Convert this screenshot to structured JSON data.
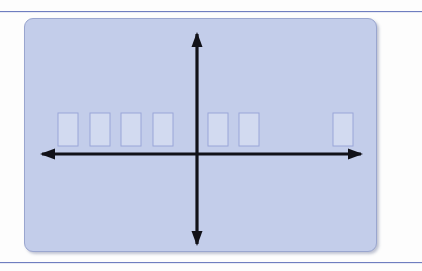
{
  "slide": {
    "background_color": "#fdfdfd",
    "rule_color": "#6f7ec0",
    "title": ""
  },
  "panel": {
    "name": "coordinate-plane-panel",
    "fill_color": "#c3cdea",
    "border_color": "#9aa6cf",
    "x": 24,
    "y": 18,
    "width": 351,
    "height": 232,
    "corner_radius": 9
  },
  "axes": {
    "color": "#111118",
    "stroke_width": 3.2,
    "origin": {
      "x": 172,
      "y": 135
    },
    "x_axis": {
      "name": "x-axis",
      "from_x": 17,
      "to_x": 336,
      "y": 135,
      "arrow_left": true,
      "arrow_right": true,
      "label": ""
    },
    "y_axis": {
      "name": "y-axis",
      "from_y": 15,
      "to_y": 225,
      "x": 172,
      "arrow_up": true,
      "arrow_down": true,
      "label": ""
    }
  },
  "chart_data": {
    "type": "bar",
    "title": "",
    "subtitle": "",
    "xlabel": "",
    "ylabel": "",
    "grid": false,
    "legend": null,
    "annotations": [],
    "axis_style": "double-arrow cartesian axes",
    "note": "Seven equal-height light rectangles resting on the x-axis; four left of the origin, two just right of the origin, and one isolated at the far right.",
    "bar_fill_color": "#d2daf0",
    "bar_border_color": "#9aa6d8",
    "bar_width": 20,
    "bar_height": 33,
    "baseline_y": 135,
    "categories": [
      "1",
      "2",
      "3",
      "4",
      "5",
      "6",
      "7"
    ],
    "values": [
      33,
      33,
      33,
      33,
      33,
      33,
      33
    ],
    "xlim": [
      17,
      336
    ],
    "ylim": [
      15,
      225
    ],
    "bars": [
      {
        "index": 0,
        "name": "bar-1",
        "x": 33,
        "y": 94,
        "width": 20,
        "height": 33,
        "side": "left-of-origin"
      },
      {
        "index": 1,
        "name": "bar-2",
        "x": 65,
        "y": 94,
        "width": 20,
        "height": 33,
        "side": "left-of-origin"
      },
      {
        "index": 2,
        "name": "bar-3",
        "x": 96,
        "y": 94,
        "width": 20,
        "height": 33,
        "side": "left-of-origin"
      },
      {
        "index": 3,
        "name": "bar-4",
        "x": 128,
        "y": 94,
        "width": 20,
        "height": 33,
        "side": "left-of-origin"
      },
      {
        "index": 4,
        "name": "bar-5",
        "x": 183,
        "y": 94,
        "width": 20,
        "height": 33,
        "side": "right-of-origin"
      },
      {
        "index": 5,
        "name": "bar-6",
        "x": 214,
        "y": 94,
        "width": 20,
        "height": 33,
        "side": "right-of-origin"
      },
      {
        "index": 6,
        "name": "bar-7",
        "x": 308,
        "y": 94,
        "width": 20,
        "height": 33,
        "side": "right-of-origin"
      }
    ]
  }
}
